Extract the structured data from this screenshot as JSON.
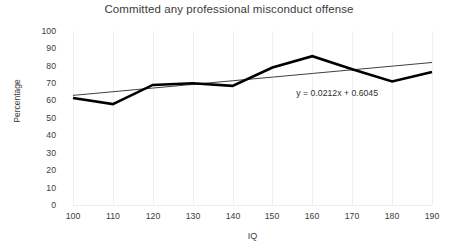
{
  "chart_data": {
    "type": "line",
    "title": "Committed any professional misconduct offense",
    "xlabel": "IQ",
    "ylabel": "Percentage",
    "xlim": [
      100,
      190
    ],
    "ylim": [
      0,
      100
    ],
    "xticks": [
      "100",
      "110",
      "120",
      "130",
      "140",
      "150",
      "160",
      "170",
      "180",
      "190"
    ],
    "yticks": [
      "100",
      "90",
      "80",
      "70",
      "60",
      "50",
      "40",
      "30",
      "20",
      "10",
      "0"
    ],
    "grid": "vertical-only",
    "legend": "none",
    "categories": [
      100,
      110,
      120,
      130,
      140,
      150,
      160,
      170,
      180,
      190
    ],
    "series": [
      {
        "name": "Committed any professional misconduct offense",
        "color": "#000000",
        "values": [
          61.5,
          58,
          69,
          70,
          68.5,
          79,
          85.5,
          78,
          71,
          76.5
        ]
      },
      {
        "name": "Linear trendline",
        "color": "#404040",
        "values": [
          63,
          65.1,
          67.2,
          69.3,
          71.4,
          73.5,
          75.6,
          77.7,
          79.8,
          81.9
        ]
      }
    ],
    "annotations": [
      {
        "name": "trendline-equation",
        "text": "y = 0.0212x + 0.6045",
        "x": 157,
        "y": 64
      }
    ]
  }
}
